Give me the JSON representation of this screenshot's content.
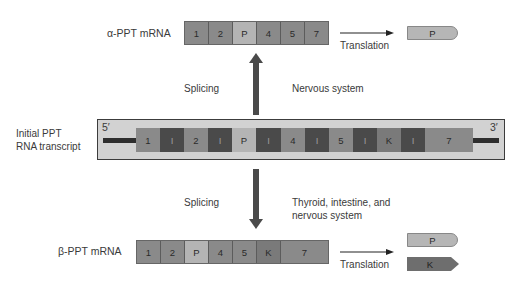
{
  "alpha_mrna": {
    "label": "α-PPT mRNA",
    "segments": [
      "1",
      "2",
      "P",
      "4",
      "5",
      "7"
    ],
    "translation_label": "Translation",
    "proteins": [
      "P"
    ]
  },
  "upper_splicing": {
    "left_label": "Splicing",
    "right_label": "Nervous system"
  },
  "transcript": {
    "label_line1": "Initial PPT",
    "label_line2": "RNA transcript",
    "five_prime": "5′",
    "three_prime": "3′",
    "segments": [
      "1",
      "I",
      "2",
      "I",
      "P",
      "I",
      "4",
      "I",
      "5",
      "I",
      "K",
      "I",
      "7"
    ]
  },
  "lower_splicing": {
    "left_label": "Splicing",
    "right_label_line1": "Thyroid, intestine, and",
    "right_label_line2": "nervous system"
  },
  "beta_mrna": {
    "label": "β-PPT mRNA",
    "segments": [
      "1",
      "2",
      "P",
      "4",
      "5",
      "K",
      "7"
    ],
    "translation_label": "Translation",
    "proteins": [
      "P",
      "K"
    ]
  },
  "colors": {
    "exon": "#8a8a8a",
    "exon_p": "#b4b4b4",
    "intron": "#4a4a4a",
    "transcript_bg": "#d2d2d2",
    "arrow": "#4a4a4a"
  }
}
